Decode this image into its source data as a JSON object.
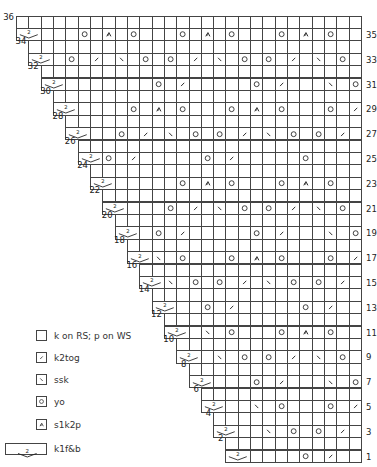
{
  "chart_data": {
    "type": "knitting-chart",
    "title": "",
    "rows_total": 36,
    "columns_max": 28,
    "shape": "right-aligned staircase; each pair of rows (WS even + RS odd) is 1 stitch narrower on the left going down",
    "reading": "RS rows odd (labels right), WS rows even (labels left, plain knit/purl)",
    "symbol_positions_note": "positions counted from right edge of chart (1 = rightmost stitch)",
    "rows": [
      {
        "row": 36,
        "width": 28,
        "side": "WS",
        "stitches": []
      },
      {
        "row": 35,
        "width": 28,
        "side": "RS",
        "stitches": [
          {
            "col": 28,
            "sym": "k1fb"
          },
          {
            "col": 23,
            "sym": "yo"
          },
          {
            "col": 21,
            "sym": "s1k2p"
          },
          {
            "col": 19,
            "sym": "yo"
          },
          {
            "col": 15,
            "sym": "yo"
          },
          {
            "col": 13,
            "sym": "s1k2p"
          },
          {
            "col": 11,
            "sym": "yo"
          },
          {
            "col": 7,
            "sym": "yo"
          },
          {
            "col": 5,
            "sym": "s1k2p"
          },
          {
            "col": 3,
            "sym": "yo"
          }
        ]
      },
      {
        "row": 34,
        "width": 27,
        "side": "WS",
        "stitches": []
      },
      {
        "row": 33,
        "width": 27,
        "side": "RS",
        "stitches": [
          {
            "col": 27,
            "sym": "k1fb"
          },
          {
            "col": 24,
            "sym": "yo"
          },
          {
            "col": 22,
            "sym": "k2tog"
          },
          {
            "col": 20,
            "sym": "ssk"
          },
          {
            "col": 18,
            "sym": "yo"
          },
          {
            "col": 16,
            "sym": "yo"
          },
          {
            "col": 14,
            "sym": "k2tog"
          },
          {
            "col": 12,
            "sym": "ssk"
          },
          {
            "col": 10,
            "sym": "yo"
          },
          {
            "col": 8,
            "sym": "yo"
          },
          {
            "col": 6,
            "sym": "k2tog"
          },
          {
            "col": 4,
            "sym": "ssk"
          },
          {
            "col": 2,
            "sym": "yo"
          }
        ]
      },
      {
        "row": 32,
        "width": 26,
        "side": "WS",
        "stitches": []
      },
      {
        "row": 31,
        "width": 26,
        "side": "RS",
        "stitches": [
          {
            "col": 26,
            "sym": "k1fb"
          },
          {
            "col": 17,
            "sym": "yo"
          },
          {
            "col": 15,
            "sym": "k2tog"
          },
          {
            "col": 9,
            "sym": "yo"
          },
          {
            "col": 7,
            "sym": "k2tog"
          },
          {
            "col": 3,
            "sym": "ssk"
          },
          {
            "col": 1,
            "sym": "yo"
          }
        ]
      },
      {
        "row": 30,
        "width": 25,
        "side": "WS",
        "stitches": []
      },
      {
        "row": 29,
        "width": 25,
        "side": "RS",
        "stitches": [
          {
            "col": 25,
            "sym": "k1fb"
          },
          {
            "col": 19,
            "sym": "yo"
          },
          {
            "col": 17,
            "sym": "s1k2p"
          },
          {
            "col": 15,
            "sym": "yo"
          },
          {
            "col": 11,
            "sym": "yo"
          },
          {
            "col": 9,
            "sym": "s1k2p"
          },
          {
            "col": 7,
            "sym": "yo"
          },
          {
            "col": 3,
            "sym": "yo"
          },
          {
            "col": 1,
            "sym": "k2tog"
          }
        ]
      },
      {
        "row": 28,
        "width": 24,
        "side": "WS",
        "stitches": []
      },
      {
        "row": 27,
        "width": 24,
        "side": "RS",
        "stitches": [
          {
            "col": 24,
            "sym": "k1fb"
          },
          {
            "col": 20,
            "sym": "yo"
          },
          {
            "col": 18,
            "sym": "k2tog"
          },
          {
            "col": 16,
            "sym": "ssk"
          },
          {
            "col": 14,
            "sym": "yo"
          },
          {
            "col": 12,
            "sym": "yo"
          },
          {
            "col": 10,
            "sym": "k2tog"
          },
          {
            "col": 8,
            "sym": "ssk"
          },
          {
            "col": 6,
            "sym": "yo"
          },
          {
            "col": 4,
            "sym": "yo"
          },
          {
            "col": 2,
            "sym": "k2tog"
          }
        ]
      },
      {
        "row": 26,
        "width": 23,
        "side": "WS",
        "stitches": []
      },
      {
        "row": 25,
        "width": 23,
        "side": "RS",
        "stitches": [
          {
            "col": 23,
            "sym": "k1fb"
          },
          {
            "col": 21,
            "sym": "yo"
          },
          {
            "col": 19,
            "sym": "k2tog"
          },
          {
            "col": 13,
            "sym": "yo"
          },
          {
            "col": 11,
            "sym": "k2tog"
          },
          {
            "col": 5,
            "sym": "yo"
          }
        ]
      },
      {
        "row": 24,
        "width": 22,
        "side": "WS",
        "stitches": []
      },
      {
        "row": 23,
        "width": 22,
        "side": "RS",
        "stitches": [
          {
            "col": 22,
            "sym": "k1fb"
          },
          {
            "col": 15,
            "sym": "yo"
          },
          {
            "col": 13,
            "sym": "s1k2p"
          },
          {
            "col": 11,
            "sym": "yo"
          },
          {
            "col": 7,
            "sym": "yo"
          },
          {
            "col": 5,
            "sym": "s1k2p"
          },
          {
            "col": 3,
            "sym": "yo"
          }
        ]
      },
      {
        "row": 22,
        "width": 21,
        "side": "WS",
        "stitches": []
      },
      {
        "row": 21,
        "width": 21,
        "side": "RS",
        "stitches": [
          {
            "col": 21,
            "sym": "k1fb"
          },
          {
            "col": 16,
            "sym": "yo"
          },
          {
            "col": 14,
            "sym": "k2tog"
          },
          {
            "col": 12,
            "sym": "ssk"
          },
          {
            "col": 10,
            "sym": "yo"
          },
          {
            "col": 8,
            "sym": "yo"
          },
          {
            "col": 6,
            "sym": "k2tog"
          },
          {
            "col": 4,
            "sym": "ssk"
          },
          {
            "col": 2,
            "sym": "yo"
          }
        ]
      },
      {
        "row": 20,
        "width": 20,
        "side": "WS",
        "stitches": []
      },
      {
        "row": 19,
        "width": 20,
        "side": "RS",
        "stitches": [
          {
            "col": 20,
            "sym": "k1fb"
          },
          {
            "col": 17,
            "sym": "yo"
          },
          {
            "col": 15,
            "sym": "k2tog"
          },
          {
            "col": 9,
            "sym": "yo"
          },
          {
            "col": 7,
            "sym": "k2tog"
          },
          {
            "col": 3,
            "sym": "ssk"
          },
          {
            "col": 1,
            "sym": "yo"
          }
        ]
      },
      {
        "row": 18,
        "width": 19,
        "side": "WS",
        "stitches": []
      },
      {
        "row": 17,
        "width": 19,
        "side": "RS",
        "stitches": [
          {
            "col": 19,
            "sym": "k1fb"
          },
          {
            "col": 17,
            "sym": "ssk"
          },
          {
            "col": 15,
            "sym": "yo"
          },
          {
            "col": 11,
            "sym": "yo"
          },
          {
            "col": 9,
            "sym": "s1k2p"
          },
          {
            "col": 7,
            "sym": "yo"
          },
          {
            "col": 3,
            "sym": "yo"
          },
          {
            "col": 1,
            "sym": "k2tog"
          }
        ]
      },
      {
        "row": 16,
        "width": 18,
        "side": "WS",
        "stitches": []
      },
      {
        "row": 15,
        "width": 18,
        "side": "RS",
        "stitches": [
          {
            "col": 18,
            "sym": "k1fb"
          },
          {
            "col": 16,
            "sym": "ssk"
          },
          {
            "col": 14,
            "sym": "yo"
          },
          {
            "col": 12,
            "sym": "yo"
          },
          {
            "col": 10,
            "sym": "k2tog"
          },
          {
            "col": 8,
            "sym": "ssk"
          },
          {
            "col": 6,
            "sym": "yo"
          },
          {
            "col": 4,
            "sym": "yo"
          },
          {
            "col": 2,
            "sym": "k2tog"
          }
        ]
      },
      {
        "row": 14,
        "width": 17,
        "side": "WS",
        "stitches": []
      },
      {
        "row": 13,
        "width": 17,
        "side": "RS",
        "stitches": [
          {
            "col": 17,
            "sym": "k1fb"
          },
          {
            "col": 13,
            "sym": "yo"
          },
          {
            "col": 11,
            "sym": "k2tog"
          },
          {
            "col": 5,
            "sym": "yo"
          },
          {
            "col": 3,
            "sym": "k2tog"
          }
        ]
      },
      {
        "row": 12,
        "width": 16,
        "side": "WS",
        "stitches": []
      },
      {
        "row": 11,
        "width": 16,
        "side": "RS",
        "stitches": [
          {
            "col": 16,
            "sym": "k1fb"
          },
          {
            "col": 13,
            "sym": "ssk"
          },
          {
            "col": 11,
            "sym": "yo"
          },
          {
            "col": 7,
            "sym": "yo"
          },
          {
            "col": 5,
            "sym": "s1k2p"
          },
          {
            "col": 3,
            "sym": "yo"
          }
        ]
      },
      {
        "row": 10,
        "width": 15,
        "side": "WS",
        "stitches": []
      },
      {
        "row": 9,
        "width": 15,
        "side": "RS",
        "stitches": [
          {
            "col": 15,
            "sym": "k1fb"
          },
          {
            "col": 12,
            "sym": "ssk"
          },
          {
            "col": 10,
            "sym": "yo"
          },
          {
            "col": 8,
            "sym": "yo"
          },
          {
            "col": 6,
            "sym": "k2tog"
          },
          {
            "col": 4,
            "sym": "ssk"
          },
          {
            "col": 2,
            "sym": "yo"
          }
        ]
      },
      {
        "row": 8,
        "width": 14,
        "side": "WS",
        "stitches": []
      },
      {
        "row": 7,
        "width": 14,
        "side": "RS",
        "stitches": [
          {
            "col": 14,
            "sym": "k1fb"
          },
          {
            "col": 9,
            "sym": "yo"
          },
          {
            "col": 7,
            "sym": "k2tog"
          },
          {
            "col": 3,
            "sym": "ssk"
          },
          {
            "col": 1,
            "sym": "yo"
          }
        ]
      },
      {
        "row": 6,
        "width": 13,
        "side": "WS",
        "stitches": []
      },
      {
        "row": 5,
        "width": 13,
        "side": "RS",
        "stitches": [
          {
            "col": 13,
            "sym": "k1fb"
          },
          {
            "col": 9,
            "sym": "ssk"
          },
          {
            "col": 7,
            "sym": "yo"
          },
          {
            "col": 3,
            "sym": "yo"
          },
          {
            "col": 1,
            "sym": "k2tog"
          }
        ]
      },
      {
        "row": 4,
        "width": 12,
        "side": "WS",
        "stitches": []
      },
      {
        "row": 3,
        "width": 12,
        "side": "RS",
        "stitches": [
          {
            "col": 12,
            "sym": "k1fb"
          },
          {
            "col": 8,
            "sym": "ssk"
          },
          {
            "col": 6,
            "sym": "yo"
          },
          {
            "col": 4,
            "sym": "yo"
          },
          {
            "col": 2,
            "sym": "k2tog"
          }
        ]
      },
      {
        "row": 2,
        "width": 11,
        "side": "WS",
        "stitches": []
      },
      {
        "row": 1,
        "width": 11,
        "side": "RS",
        "stitches": [
          {
            "col": 11,
            "sym": "k1fb"
          },
          {
            "col": 5,
            "sym": "yo"
          },
          {
            "col": 3,
            "sym": "k2tog"
          }
        ]
      }
    ],
    "legend": [
      {
        "sym": "knit",
        "label": "k on RS; p on WS"
      },
      {
        "sym": "k2tog",
        "label": "k2tog"
      },
      {
        "sym": "ssk",
        "label": "ssk"
      },
      {
        "sym": "yo",
        "label": "yo"
      },
      {
        "sym": "s1k2p",
        "label": "s1k2p"
      },
      {
        "sym": "k1fb",
        "label": "k1f&b",
        "glyph_text": "2"
      }
    ]
  },
  "colors": {
    "grid": "#444444",
    "symbol": "#222222",
    "background": "#ffffff"
  }
}
